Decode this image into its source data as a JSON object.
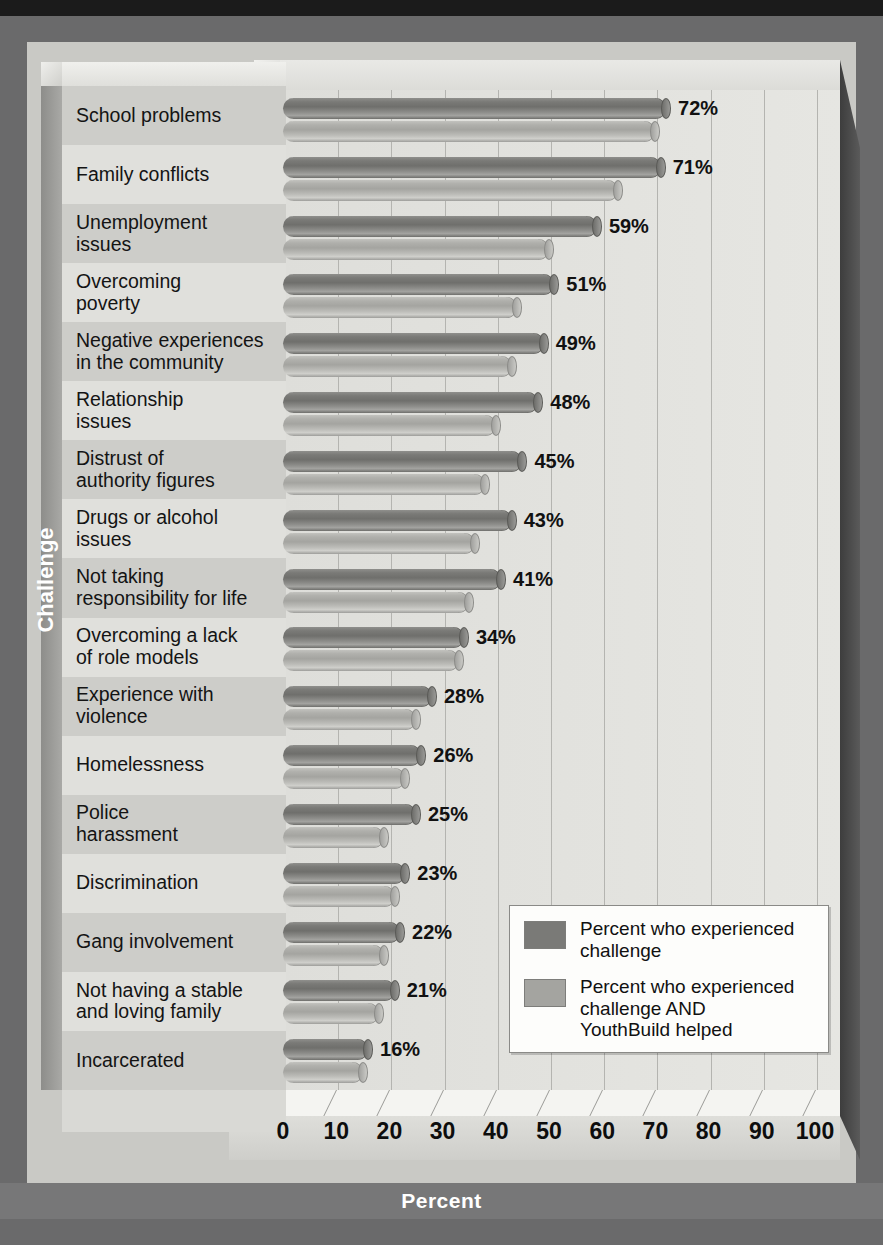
{
  "chart_data": {
    "type": "bar",
    "orientation": "horizontal",
    "title": "",
    "xlabel": "Percent",
    "ylabel": "Challenge",
    "xlim": [
      0,
      100
    ],
    "xticks": [
      "0",
      "10",
      "20",
      "30",
      "40",
      "50",
      "60",
      "70",
      "80",
      "90",
      "100"
    ],
    "grid": "vertical",
    "legend_position": "bottom-right",
    "categories": [
      "School problems",
      "Family conflicts",
      "Unemployment issues",
      "Overcoming poverty",
      "Negative experiences in the community",
      "Relationship issues",
      "Distrust of authority figures",
      "Drugs or alcohol issues",
      "Not taking responsibility for life",
      "Overcoming a lack of role models",
      "Experience with violence",
      "Homelessness",
      "Police harassment",
      "Discrimination",
      "Gang involvement",
      "Not having a stable and loving family",
      "Incarcerated"
    ],
    "category_lines": [
      [
        "School problems"
      ],
      [
        "Family conflicts"
      ],
      [
        "Unemployment",
        "issues"
      ],
      [
        "Overcoming",
        "poverty"
      ],
      [
        "Negative experiences",
        "in the community"
      ],
      [
        "Relationship",
        "issues"
      ],
      [
        "Distrust of",
        "authority figures"
      ],
      [
        "Drugs or alcohol",
        "issues"
      ],
      [
        "Not taking",
        "responsibility for life"
      ],
      [
        "Overcoming a lack",
        "of role models"
      ],
      [
        "Experience with",
        "violence"
      ],
      [
        "Homelessness"
      ],
      [
        "Police",
        "harassment"
      ],
      [
        "Discrimination"
      ],
      [
        "Gang involvement"
      ],
      [
        "Not having a stable",
        "and loving family"
      ],
      [
        "Incarcerated"
      ]
    ],
    "series": [
      {
        "name": "Percent who experienced challenge",
        "color": "#7a7a77",
        "values": [
          72,
          71,
          59,
          51,
          49,
          48,
          45,
          43,
          41,
          34,
          28,
          26,
          25,
          23,
          22,
          21,
          16
        ],
        "labels": [
          "72%",
          "71%",
          "59%",
          "51%",
          "49%",
          "48%",
          "45%",
          "43%",
          "41%",
          "34%",
          "28%",
          "26%",
          "25%",
          "23%",
          "22%",
          "21%",
          "16%"
        ]
      },
      {
        "name": "Percent who experienced challenge AND YouthBuild helped",
        "color": "#a4a4a0",
        "values": [
          70,
          63,
          50,
          44,
          43,
          40,
          38,
          36,
          35,
          33,
          25,
          23,
          19,
          21,
          19,
          18,
          15
        ],
        "labels": []
      }
    ]
  },
  "legend": {
    "items": [
      {
        "swatch_color": "#7a7a77",
        "lines": [
          "Percent who experienced",
          "challenge"
        ]
      },
      {
        "swatch_color": "#a4a4a0",
        "lines": [
          "Percent who experienced",
          "challenge AND",
          "YouthBuild helped"
        ]
      }
    ]
  },
  "axis": {
    "x_title": "Percent",
    "y_title": "Challenge"
  }
}
